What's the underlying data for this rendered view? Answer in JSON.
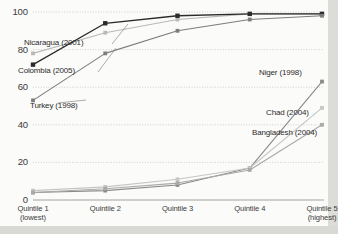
{
  "chart_data": {
    "type": "line",
    "title": "",
    "xlabel": "",
    "ylabel": "",
    "ylim": [
      0,
      100
    ],
    "yticks": [
      0,
      20,
      40,
      60,
      80,
      100
    ],
    "grid": true,
    "legend_position": "inline-annotations",
    "categories": [
      "Quintile 1",
      "Quintile 2",
      "Quintile 3",
      "Quintile 4",
      "Quintile 5"
    ],
    "category_sublabels": [
      "(lowest)",
      "",
      "",
      "",
      "(highest)"
    ],
    "series": [
      {
        "name": "Nicaragua (2001)",
        "values": [
          78,
          89,
          96,
          99,
          99
        ],
        "color": "#b9b9b7"
      },
      {
        "name": "Colombia (2005)",
        "values": [
          72,
          94,
          98,
          99,
          99
        ],
        "color": "#2b2b2b"
      },
      {
        "name": "Turkey (1998)",
        "values": [
          53,
          78,
          90,
          96,
          98
        ],
        "color": "#7d7d7b"
      },
      {
        "name": "Niger (1998)",
        "values": [
          4,
          5,
          8,
          17,
          63
        ],
        "color": "#8a8a88"
      },
      {
        "name": "Chad (2004)",
        "values": [
          5,
          7,
          11,
          17,
          49
        ],
        "color": "#c6c6c4"
      },
      {
        "name": "Bangladesh (2004)",
        "values": [
          4,
          6,
          9,
          16,
          40
        ],
        "color": "#a9a9a7"
      }
    ]
  },
  "axis": {
    "y_tick_labels": [
      "100",
      "80",
      "60",
      "40",
      "20",
      "0"
    ]
  },
  "annotations": [
    {
      "label": "Nicaragua (2001)",
      "side": "left"
    },
    {
      "label": "Colombia (2005)",
      "side": "left"
    },
    {
      "label": "Turkey (1998)",
      "side": "left"
    },
    {
      "label": "Niger (1998)",
      "side": "right"
    },
    {
      "label": "Chad (2004)",
      "side": "right"
    },
    {
      "label": "Bangladesh (2004)",
      "side": "right"
    }
  ],
  "title_sliver": ""
}
